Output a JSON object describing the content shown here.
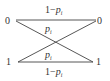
{
  "diagram": {
    "colors": {
      "line": "#444444",
      "text": "#333333",
      "background": "#ffffff"
    },
    "nodes": {
      "input_0": "0",
      "input_1": "1",
      "output_0": "0",
      "output_1": "1"
    },
    "edges": [
      {
        "from": "input_0",
        "to": "output_0",
        "label_prefix": "1−",
        "label_var": "p",
        "label_sub": "i"
      },
      {
        "from": "input_0",
        "to": "output_1",
        "label_prefix": "",
        "label_var": "p",
        "label_sub": "i"
      },
      {
        "from": "input_1",
        "to": "output_0",
        "label_prefix": "",
        "label_var": "p",
        "label_sub": "i"
      },
      {
        "from": "input_1",
        "to": "output_1",
        "label_prefix": "1−",
        "label_var": "p",
        "label_sub": "i"
      }
    ]
  }
}
